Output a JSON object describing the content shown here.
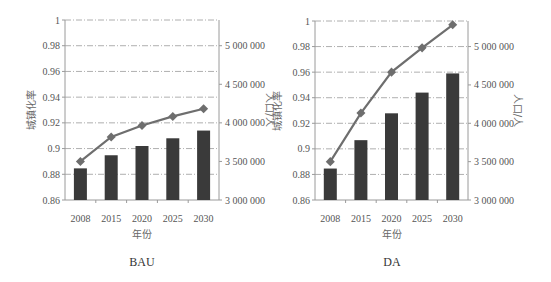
{
  "chart_data": [
    {
      "type": "bar+line",
      "title": "BAU",
      "xlabel": "年份",
      "ylabel_left": "城镇化率",
      "ylabel_right": "人口/人",
      "categories": [
        "2008",
        "2015",
        "2020",
        "2025",
        "2030"
      ],
      "ylim_left": [
        0.86,
        1
      ],
      "yticks_left": [
        "0.86",
        "0.88",
        "0.9",
        "0.92",
        "0.94",
        "0.96",
        "0.98",
        "1"
      ],
      "ylim_right": [
        3000000,
        5333333
      ],
      "yticks_right": [
        "3 000 000",
        "3 500 000",
        "4 000 000",
        "4 500 000",
        "5 000 000"
      ],
      "series": [
        {
          "name": "人口/人",
          "kind": "bar",
          "axis": "right",
          "values": [
            3410000,
            3580000,
            3700000,
            3800000,
            3900000
          ]
        },
        {
          "name": "城镇化率",
          "kind": "line",
          "axis": "left",
          "values": [
            0.89,
            0.909,
            0.918,
            0.925,
            0.931
          ]
        }
      ],
      "grid": "dash-dot horizontal"
    },
    {
      "type": "bar+line",
      "title": "DA",
      "xlabel": "年份",
      "ylabel_left": "城镇化率",
      "ylabel_right": "人口/人",
      "categories": [
        "2008",
        "2015",
        "2020",
        "2025",
        "2030"
      ],
      "ylim_left": [
        0.86,
        1
      ],
      "yticks_left": [
        "0.86",
        "0.88",
        "0.9",
        "0.92",
        "0.94",
        "0.96",
        "0.98",
        "1"
      ],
      "ylim_right": [
        3000000,
        5333333
      ],
      "yticks_right": [
        "3 000 000",
        "3 500 000",
        "4 000 000",
        "4 500 000",
        "5 000 000"
      ],
      "series": [
        {
          "name": "人口/人",
          "kind": "bar",
          "axis": "right",
          "values": [
            3410000,
            3780000,
            4130000,
            4400000,
            4650000
          ]
        },
        {
          "name": "城镇化率",
          "kind": "line",
          "axis": "left",
          "values": [
            0.89,
            0.928,
            0.96,
            0.979,
            0.997
          ]
        }
      ],
      "grid": "dash-dot horizontal"
    }
  ],
  "colors": {
    "bar": "#3a3a3a",
    "line": "#6e6e6e",
    "grid": "#9a9a9a",
    "axis": "#9a9a9a"
  }
}
